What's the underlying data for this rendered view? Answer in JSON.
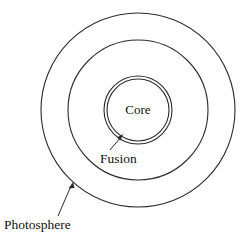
{
  "diagram": {
    "background_color": "#ffffff",
    "stroke_color": "#2b2b2b",
    "text_color": "#111111",
    "center": {
      "x": 138,
      "y": 110
    },
    "layers": [
      {
        "id": "photosphere",
        "label": "Photosphere",
        "shape": "circle",
        "radius": 97,
        "label_position": {
          "x": 4,
          "y": 229
        },
        "leader": {
          "from": {
            "x": 60,
            "y": 215
          },
          "to": {
            "x": 73,
            "y": 185
          },
          "arrow": true
        }
      },
      {
        "id": "convective-zone",
        "label": "",
        "shape": "circle",
        "radius": 70,
        "label_position": null,
        "leader": null
      },
      {
        "id": "fusion",
        "label": "Fusion",
        "shape": "double-circle",
        "radius": 34,
        "inner_radius": 31,
        "label_position": {
          "x": 100,
          "y": 163
        },
        "leader": {
          "from": {
            "x": 110,
            "y": 150
          },
          "to": {
            "x": 122,
            "y": 136
          },
          "arrow": true
        }
      },
      {
        "id": "core",
        "label": "Core",
        "shape": "circle",
        "radius": 31,
        "label_position": {
          "x": 138,
          "y": 114
        },
        "leader": null
      }
    ]
  }
}
